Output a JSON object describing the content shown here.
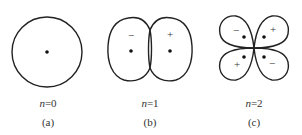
{
  "figure": {
    "panels": [
      {
        "id": "a",
        "n_label": "n=0",
        "n_var": "n",
        "n_value": "=0",
        "caption": "(a)",
        "signs": []
      },
      {
        "id": "b",
        "n_label": "n=1",
        "n_var": "n",
        "n_value": "=1",
        "caption": "(b)",
        "signs": [
          "−",
          "+"
        ]
      },
      {
        "id": "c",
        "n_label": "n=2",
        "n_var": "n",
        "n_value": "=2",
        "caption": "(c)",
        "signs": [
          "−",
          "+",
          "+",
          "−"
        ]
      }
    ]
  }
}
